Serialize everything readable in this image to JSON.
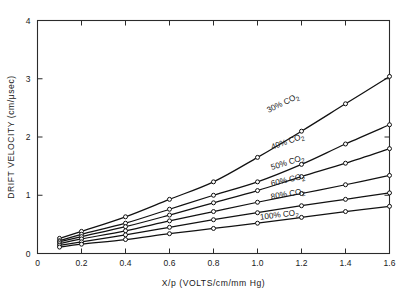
{
  "chart_data": {
    "type": "line",
    "title": "",
    "subtitle": "",
    "xlabel": "X/p (VOLTS/cm/mm Hg)",
    "ylabel": "DRIFT VELOCITY (cm/μsec)",
    "xlim": [
      0,
      1.6
    ],
    "ylim": [
      0,
      4
    ],
    "xticks": [
      0,
      0.2,
      0.4,
      0.6,
      0.8,
      1.0,
      1.2,
      1.4,
      1.6
    ],
    "xticklabels": [
      "0",
      "0.2",
      "0.4",
      "0.6",
      "0.8",
      "1.0",
      "1.2",
      "1.4",
      "1.6"
    ],
    "yticks": [
      0,
      1,
      2,
      3,
      4
    ],
    "yticklabels": [
      "0",
      "1",
      "2",
      "3",
      "4"
    ],
    "grid": false,
    "legend_position": "inline-curve-labels",
    "marker": "open-circle",
    "x": [
      0.1,
      0.2,
      0.4,
      0.6,
      0.8,
      1.0,
      1.2,
      1.4,
      1.6
    ],
    "series": [
      {
        "name": "30% CO2",
        "label_text": "30% CO",
        "label_sub": "2",
        "label_angle": -26,
        "label_x": 1.12,
        "label_y": 2.54,
        "values": [
          0.26,
          0.38,
          0.63,
          0.93,
          1.23,
          1.65,
          2.1,
          2.57,
          3.04
        ]
      },
      {
        "name": "40% CO2",
        "label_text": "40% CO",
        "label_sub": "2",
        "label_angle": -20,
        "label_x": 1.14,
        "label_y": 1.88,
        "values": [
          0.22,
          0.33,
          0.52,
          0.76,
          1.0,
          1.23,
          1.53,
          1.88,
          2.21
        ]
      },
      {
        "name": "50% CO2",
        "label_text": "50% CO",
        "label_sub": "2",
        "label_angle": -17,
        "label_x": 1.14,
        "label_y": 1.52,
        "values": [
          0.2,
          0.29,
          0.46,
          0.66,
          0.87,
          1.08,
          1.32,
          1.55,
          1.8
        ]
      },
      {
        "name": "60% CO2",
        "label_text": "60% CO",
        "label_sub": "2",
        "label_angle": -13,
        "label_x": 1.14,
        "label_y": 1.22,
        "values": [
          0.17,
          0.25,
          0.39,
          0.56,
          0.72,
          0.88,
          1.03,
          1.18,
          1.34
        ]
      },
      {
        "name": "80% CO2",
        "label_text": "80% CO",
        "label_sub": "2",
        "label_angle": -10,
        "label_x": 1.14,
        "label_y": 0.98,
        "values": [
          0.14,
          0.2,
          0.32,
          0.45,
          0.58,
          0.7,
          0.82,
          0.93,
          1.04
        ]
      },
      {
        "name": "100% CO2",
        "label_text": "100% CO",
        "label_sub": "2",
        "label_angle": -7,
        "label_x": 1.1,
        "label_y": 0.62,
        "values": [
          0.11,
          0.16,
          0.24,
          0.34,
          0.43,
          0.52,
          0.62,
          0.72,
          0.81
        ]
      }
    ]
  }
}
